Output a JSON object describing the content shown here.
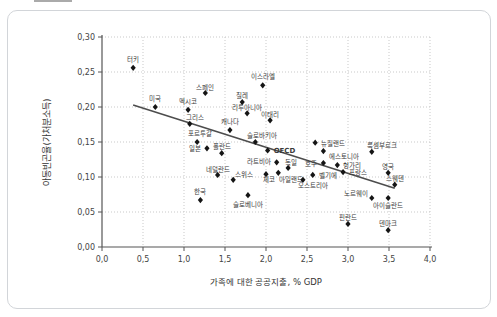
{
  "page": {
    "background": "#ffffff",
    "panel_border": "#d2d5d9",
    "top_artifact": "cropped-element-remnant"
  },
  "chart_data": {
    "type": "scatter",
    "title": "",
    "xlabel": "가족에 대한 공공지출, % GDP",
    "ylabel": "아동빈곤율(가처분소득)",
    "xlim": [
      0.0,
      4.0
    ],
    "ylim": [
      0.0,
      0.3
    ],
    "grid": "dotted",
    "legend": null,
    "decimal_separator": ",",
    "colors": {
      "point": "#151515",
      "trend": "#4d4d4d",
      "grid": "#c9c9c9",
      "axis": "#555555"
    },
    "x_ticks": [
      {
        "v": 0.0,
        "label": "0,0"
      },
      {
        "v": 0.5,
        "label": "0,5"
      },
      {
        "v": 1.0,
        "label": "1,0"
      },
      {
        "v": 1.5,
        "label": "1,5"
      },
      {
        "v": 2.0,
        "label": "2,0"
      },
      {
        "v": 2.5,
        "label": "2,5"
      },
      {
        "v": 3.0,
        "label": "3,0"
      },
      {
        "v": 3.5,
        "label": "3,5"
      },
      {
        "v": 4.0,
        "label": "4,0"
      }
    ],
    "y_ticks": [
      {
        "v": 0.0,
        "label": "0,00"
      },
      {
        "v": 0.05,
        "label": "0,05"
      },
      {
        "v": 0.1,
        "label": "0,10"
      },
      {
        "v": 0.15,
        "label": "0,15"
      },
      {
        "v": 0.2,
        "label": "0,20"
      },
      {
        "v": 0.25,
        "label": "0,25"
      },
      {
        "v": 0.3,
        "label": "0,30"
      }
    ],
    "trend_line": {
      "x1": 0.38,
      "y1": 0.203,
      "x2": 3.57,
      "y2": 0.084
    },
    "points": [
      {
        "label": "터키",
        "x": 0.38,
        "y": 0.256,
        "anchor": "above"
      },
      {
        "label": "미국",
        "x": 0.65,
        "y": 0.2,
        "anchor": "above"
      },
      {
        "label": "멕시코",
        "x": 1.05,
        "y": 0.196,
        "anchor": "above"
      },
      {
        "label": "스페인",
        "x": 1.26,
        "y": 0.22,
        "anchor": "above",
        "dy": 3
      },
      {
        "label": "그리스",
        "x": 1.07,
        "y": 0.176,
        "anchor": "above",
        "dx": 5,
        "dy": 2
      },
      {
        "label": "이스라엘",
        "x": 1.96,
        "y": 0.231,
        "anchor": "above"
      },
      {
        "label": "칠레",
        "x": 1.71,
        "y": 0.207,
        "anchor": "above",
        "dy": 2
      },
      {
        "label": "리투아니아",
        "x": 1.77,
        "y": 0.191,
        "anchor": "above",
        "dy": 3
      },
      {
        "label": "이태리",
        "x": 2.05,
        "y": 0.181,
        "anchor": "above",
        "dy": 3
      },
      {
        "label": "캐나다",
        "x": 1.56,
        "y": 0.167,
        "anchor": "above"
      },
      {
        "label": "포르투갈",
        "x": 1.16,
        "y": 0.15,
        "anchor": "above",
        "dx": 3
      },
      {
        "label": "슬로바키아",
        "x": 1.87,
        "y": 0.15,
        "anchor": "above",
        "dx": 7,
        "dy": 2
      },
      {
        "label": "OECD",
        "x": 2.02,
        "y": 0.138,
        "anchor": "right",
        "bold": true
      },
      {
        "label": "일본",
        "x": 1.28,
        "y": 0.141,
        "anchor": "left"
      },
      {
        "label": "폴란드",
        "x": 1.46,
        "y": 0.134,
        "anchor": "above",
        "dy": 2
      },
      {
        "label": "라트비아",
        "x": 2.13,
        "y": 0.121,
        "anchor": "left",
        "dy": -1
      },
      {
        "label": "독일",
        "x": 2.27,
        "y": 0.113,
        "anchor": "above",
        "dx": 3,
        "dy": 3
      },
      {
        "label": "네덜란드",
        "x": 1.41,
        "y": 0.103,
        "anchor": "above",
        "dy": 3
      },
      {
        "label": "스위스",
        "x": 1.6,
        "y": 0.096,
        "anchor": "above",
        "dx": 11,
        "dy": 3
      },
      {
        "label": "체코",
        "x": 2.0,
        "y": 0.104,
        "anchor": "below",
        "dx": 3,
        "dy": -4
      },
      {
        "label": "아일랜드",
        "x": 2.15,
        "y": 0.106,
        "anchor": "below",
        "dx": 13,
        "dy": -3
      },
      {
        "label": "뉴질랜드",
        "x": 2.6,
        "y": 0.149,
        "anchor": "right"
      },
      {
        "label": "에스토니아",
        "x": 2.7,
        "y": 0.137,
        "anchor": "right",
        "dy": 5
      },
      {
        "label": "호주",
        "x": 2.7,
        "y": 0.12,
        "anchor": "left"
      },
      {
        "label": "헝가리",
        "x": 2.87,
        "y": 0.117,
        "anchor": "right"
      },
      {
        "label": "프랑스",
        "x": 2.94,
        "y": 0.107,
        "anchor": "right"
      },
      {
        "label": "벨기에",
        "x": 2.57,
        "y": 0.103,
        "anchor": "right"
      },
      {
        "label": "오스트리아",
        "x": 2.45,
        "y": 0.096,
        "anchor": "below",
        "dx": 10,
        "dy": -4
      },
      {
        "label": "룩셈부르크",
        "x": 3.29,
        "y": 0.136,
        "anchor": "above",
        "dx": 10,
        "dy": 2
      },
      {
        "label": "영국",
        "x": 3.49,
        "y": 0.106,
        "anchor": "above",
        "dy": 2
      },
      {
        "label": "스웨덴",
        "x": 3.57,
        "y": 0.089,
        "anchor": "above",
        "dy": 2
      },
      {
        "label": "노르웨이",
        "x": 3.29,
        "y": 0.07,
        "anchor": "left",
        "dx": 2,
        "dy": -5
      },
      {
        "label": "아이슬란드",
        "x": 3.49,
        "y": 0.07,
        "anchor": "below",
        "dy": -2
      },
      {
        "label": "한국",
        "x": 1.2,
        "y": 0.067,
        "anchor": "above"
      },
      {
        "label": "슬로베니아",
        "x": 1.78,
        "y": 0.074,
        "anchor": "below"
      },
      {
        "label": "핀란드",
        "x": 3.0,
        "y": 0.033,
        "anchor": "above",
        "dy": 2
      },
      {
        "label": "덴마크",
        "x": 3.49,
        "y": 0.024,
        "anchor": "above",
        "dy": 2
      }
    ]
  }
}
